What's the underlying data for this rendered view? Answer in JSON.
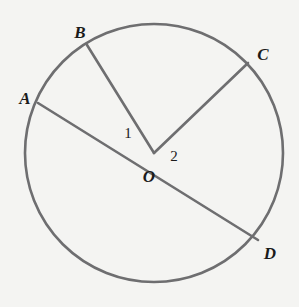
{
  "figure": {
    "background_color": "#f4f4f2",
    "stroke_color": "#6e6e70",
    "label_color": "#1b1b1b",
    "stroke_width": 2.6,
    "circle": {
      "center_x": 154,
      "center_y": 153,
      "radius": 129
    },
    "points": [
      {
        "id": "A",
        "label": "A",
        "x": 38,
        "y": 103,
        "label_x": 25,
        "label_y": 98
      },
      {
        "id": "B",
        "label": "B",
        "x": 87,
        "y": 45,
        "label_x": 80,
        "label_y": 32
      },
      {
        "id": "C",
        "label": "C",
        "x": 248,
        "y": 63,
        "label_x": 263,
        "label_y": 54
      },
      {
        "id": "D",
        "label": "D",
        "x": 258,
        "y": 240,
        "label_x": 270,
        "label_y": 253
      },
      {
        "id": "O",
        "label": "O",
        "x": 154,
        "y": 153,
        "label_x": 149,
        "label_y": 176
      }
    ],
    "segments": [
      {
        "id": "AD",
        "from": "A",
        "to": "D",
        "x1": 38,
        "y1": 103,
        "x2": 258,
        "y2": 240
      },
      {
        "id": "BO",
        "from": "B",
        "to": "O",
        "x1": 87,
        "y1": 45,
        "x2": 154,
        "y2": 153
      },
      {
        "id": "CO",
        "from": "C",
        "to": "O",
        "x1": 248,
        "y1": 63,
        "x2": 154,
        "y2": 153
      }
    ],
    "angles": [
      {
        "id": "1",
        "label": "1",
        "label_x": 128,
        "label_y": 133,
        "between": "OA and OB"
      },
      {
        "id": "2",
        "label": "2",
        "label_x": 174,
        "label_y": 156,
        "between": "OC and OD"
      }
    ]
  }
}
